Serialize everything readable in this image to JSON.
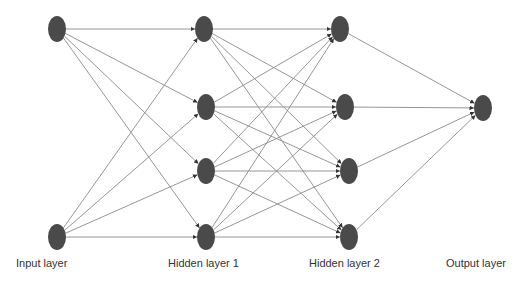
{
  "diagram": {
    "type": "neural-network",
    "colors": {
      "node": "#4a4a4a",
      "edge": "#8a8a8a",
      "label": "#333333",
      "background": "#ffffff"
    },
    "layers": [
      {
        "id": "input",
        "label": "Input layer",
        "label_x": 16,
        "nodes": [
          {
            "x": 57,
            "y": 29
          },
          {
            "x": 57,
            "y": 237
          }
        ]
      },
      {
        "id": "hidden1",
        "label": "Hidden layer 1",
        "label_x": 168,
        "nodes": [
          {
            "x": 204,
            "y": 29
          },
          {
            "x": 206,
            "y": 107
          },
          {
            "x": 206,
            "y": 171
          },
          {
            "x": 206,
            "y": 237
          }
        ]
      },
      {
        "id": "hidden2",
        "label": "Hidden layer 2",
        "label_x": 309,
        "nodes": [
          {
            "x": 340,
            "y": 29
          },
          {
            "x": 345,
            "y": 107
          },
          {
            "x": 349,
            "y": 171
          },
          {
            "x": 349,
            "y": 237
          }
        ]
      },
      {
        "id": "output",
        "label": "Output layer",
        "label_x": 446,
        "nodes": [
          {
            "x": 483,
            "y": 108
          }
        ]
      }
    ],
    "connectivity": "fully-connected between adjacent layers, arrows pointing to next layer"
  }
}
